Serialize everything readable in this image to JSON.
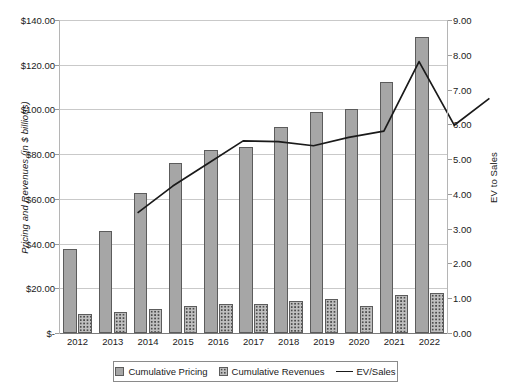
{
  "chart_data": {
    "type": "bar",
    "title": "",
    "categories": [
      "2012",
      "2013",
      "2014",
      "2015",
      "2016",
      "2017",
      "2018",
      "2019",
      "2020",
      "2021",
      "2022"
    ],
    "xlabel": "",
    "ylabel": "Pricing and Revenues (in $ billions)",
    "y2label": "EV to Sales",
    "ylim": [
      0,
      140
    ],
    "y2lim": [
      0,
      9
    ],
    "grid": true,
    "legend_position": "bottom",
    "series": [
      {
        "name": "Cumulative Pricing",
        "type": "bar",
        "axis": "left",
        "values": [
          37.6,
          45.8,
          62.8,
          76.0,
          81.8,
          83.0,
          92.0,
          98.8,
          100.0,
          112.4,
          132.4
        ]
      },
      {
        "name": "Cumulative Revenues",
        "type": "bar",
        "axis": "left",
        "values": [
          8.6,
          9.4,
          10.8,
          12.2,
          13.0,
          13.2,
          14.2,
          15.2,
          12.2,
          16.8,
          18.0
        ]
      },
      {
        "name": "EV/Sales",
        "type": "line",
        "axis": "right",
        "values": [
          4.03,
          4.8,
          5.45,
          6.1,
          6.08,
          5.96,
          6.2,
          6.38,
          8.38,
          6.55,
          7.32
        ]
      }
    ],
    "y_ticks_left": [
      "$-",
      "$20.00",
      "$40.00",
      "$60.00",
      "$80.00",
      "$100.00",
      "$120.00",
      "$140.00"
    ],
    "y_tick_values_left": [
      0,
      20,
      40,
      60,
      80,
      100,
      120,
      140
    ],
    "y_ticks_right": [
      "0.00",
      "1.00",
      "2.00",
      "3.00",
      "4.00",
      "5.00",
      "6.00",
      "7.00",
      "8.00",
      "9.00"
    ],
    "y_tick_values_right": [
      0,
      1,
      2,
      3,
      4,
      5,
      6,
      7,
      8,
      9
    ],
    "colors": {
      "bar_pricing": "#a6a6a6",
      "bar_revenue": "#bfbfbf",
      "line": "#1a1a1a",
      "grid": "#c9c9c9",
      "axis": "#7a7a7a"
    }
  },
  "legend": {
    "items": [
      {
        "label": "Cumulative Pricing"
      },
      {
        "label": "Cumulative Revenues"
      },
      {
        "label": "EV/Sales"
      }
    ]
  }
}
